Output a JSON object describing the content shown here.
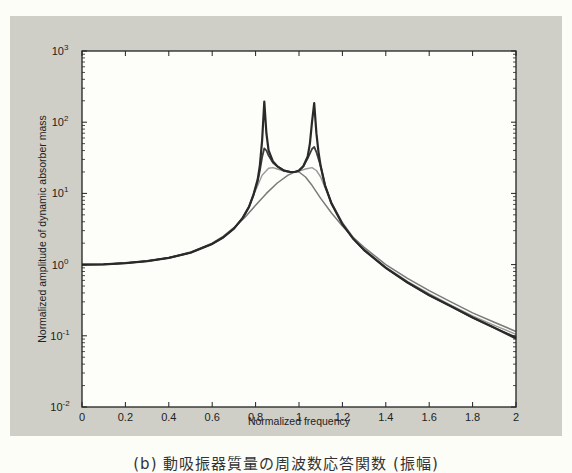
{
  "chart_data": {
    "type": "line",
    "title": "",
    "xlabel": "Normalized frequency",
    "ylabel": "Normalized amplitude of dynamic absorber mass",
    "xlim": [
      0,
      2
    ],
    "ylim": [
      0.01,
      1000
    ],
    "yscale": "log",
    "grid": false,
    "legend": null,
    "x_ticks": [
      "0",
      "0.2",
      "0.4",
      "0.6",
      "0.8",
      "1",
      "1.2",
      "1.4",
      "1.6",
      "1.8",
      "2"
    ],
    "y_ticks": [
      {
        "base": "10",
        "exp": "3",
        "value": 1000
      },
      {
        "base": "10",
        "exp": "2",
        "value": 100
      },
      {
        "base": "10",
        "exp": "1",
        "value": 10
      },
      {
        "base": "10",
        "exp": "0",
        "value": 1
      },
      {
        "base": "10",
        "exp": "-1",
        "value": 0.1
      },
      {
        "base": "10",
        "exp": "-2",
        "value": 0.01
      }
    ],
    "series": [
      {
        "name": "low damping",
        "color": "#2a2a2a",
        "width": 2.2,
        "points": [
          [
            0,
            1.0
          ],
          [
            0.1,
            1.01
          ],
          [
            0.2,
            1.05
          ],
          [
            0.3,
            1.12
          ],
          [
            0.4,
            1.24
          ],
          [
            0.5,
            1.47
          ],
          [
            0.6,
            1.95
          ],
          [
            0.65,
            2.4
          ],
          [
            0.7,
            3.2
          ],
          [
            0.74,
            4.5
          ],
          [
            0.77,
            6.5
          ],
          [
            0.79,
            9.5
          ],
          [
            0.81,
            16
          ],
          [
            0.82,
            25
          ],
          [
            0.83,
            55
          ],
          [
            0.84,
            195
          ],
          [
            0.85,
            70
          ],
          [
            0.86,
            40
          ],
          [
            0.88,
            28
          ],
          [
            0.9,
            24
          ],
          [
            0.93,
            21
          ],
          [
            0.96,
            20
          ],
          [
            0.98,
            20
          ],
          [
            1.0,
            21
          ],
          [
            1.02,
            24
          ],
          [
            1.04,
            33
          ],
          [
            1.05,
            50
          ],
          [
            1.06,
            100
          ],
          [
            1.07,
            185
          ],
          [
            1.08,
            70
          ],
          [
            1.09,
            38
          ],
          [
            1.1,
            24
          ],
          [
            1.12,
            13
          ],
          [
            1.15,
            7.2
          ],
          [
            1.2,
            3.7
          ],
          [
            1.25,
            2.3
          ],
          [
            1.3,
            1.6
          ],
          [
            1.4,
            0.9
          ],
          [
            1.5,
            0.56
          ],
          [
            1.6,
            0.37
          ],
          [
            1.7,
            0.26
          ],
          [
            1.8,
            0.18
          ],
          [
            1.9,
            0.13
          ],
          [
            2.0,
            0.092
          ]
        ]
      },
      {
        "name": "medium damping",
        "color": "#3c3c3c",
        "width": 1.8,
        "points": [
          [
            0,
            1.0
          ],
          [
            0.1,
            1.01
          ],
          [
            0.2,
            1.05
          ],
          [
            0.3,
            1.12
          ],
          [
            0.4,
            1.24
          ],
          [
            0.5,
            1.47
          ],
          [
            0.6,
            1.95
          ],
          [
            0.65,
            2.4
          ],
          [
            0.7,
            3.2
          ],
          [
            0.74,
            4.5
          ],
          [
            0.77,
            6.5
          ],
          [
            0.79,
            9.5
          ],
          [
            0.81,
            15
          ],
          [
            0.82,
            21
          ],
          [
            0.83,
            32
          ],
          [
            0.84,
            43
          ],
          [
            0.85,
            40
          ],
          [
            0.86,
            34
          ],
          [
            0.88,
            27
          ],
          [
            0.9,
            24
          ],
          [
            0.93,
            21
          ],
          [
            0.96,
            20
          ],
          [
            0.98,
            20
          ],
          [
            1.0,
            21
          ],
          [
            1.02,
            24
          ],
          [
            1.04,
            31
          ],
          [
            1.06,
            42
          ],
          [
            1.07,
            45
          ],
          [
            1.08,
            38
          ],
          [
            1.1,
            24
          ],
          [
            1.12,
            13
          ],
          [
            1.15,
            7.2
          ],
          [
            1.2,
            3.7
          ],
          [
            1.25,
            2.3
          ],
          [
            1.3,
            1.6
          ],
          [
            1.4,
            0.9
          ],
          [
            1.5,
            0.56
          ],
          [
            1.6,
            0.37
          ],
          [
            1.7,
            0.26
          ],
          [
            1.8,
            0.18
          ],
          [
            1.9,
            0.13
          ],
          [
            2.0,
            0.095
          ]
        ]
      },
      {
        "name": "high damping",
        "color": "#9a9a9a",
        "width": 1.4,
        "points": [
          [
            0,
            1.0
          ],
          [
            0.1,
            1.01
          ],
          [
            0.2,
            1.05
          ],
          [
            0.3,
            1.12
          ],
          [
            0.4,
            1.24
          ],
          [
            0.5,
            1.47
          ],
          [
            0.6,
            1.95
          ],
          [
            0.65,
            2.4
          ],
          [
            0.7,
            3.2
          ],
          [
            0.74,
            4.6
          ],
          [
            0.77,
            6.7
          ],
          [
            0.8,
            11
          ],
          [
            0.83,
            18
          ],
          [
            0.86,
            22.5
          ],
          [
            0.88,
            23
          ],
          [
            0.9,
            22
          ],
          [
            0.93,
            20.5
          ],
          [
            0.96,
            20
          ],
          [
            0.98,
            20
          ],
          [
            1.0,
            20.5
          ],
          [
            1.03,
            22
          ],
          [
            1.06,
            23
          ],
          [
            1.08,
            21
          ],
          [
            1.1,
            17
          ],
          [
            1.12,
            12
          ],
          [
            1.15,
            7.5
          ],
          [
            1.2,
            3.9
          ],
          [
            1.25,
            2.4
          ],
          [
            1.3,
            1.65
          ],
          [
            1.4,
            0.92
          ],
          [
            1.5,
            0.58
          ],
          [
            1.6,
            0.39
          ],
          [
            1.7,
            0.27
          ],
          [
            1.8,
            0.19
          ],
          [
            1.9,
            0.14
          ],
          [
            2.0,
            0.105
          ]
        ]
      },
      {
        "name": "very high damping",
        "color": "#7a7a7a",
        "width": 1.5,
        "points": [
          [
            0,
            1.0
          ],
          [
            0.1,
            1.01
          ],
          [
            0.2,
            1.05
          ],
          [
            0.3,
            1.12
          ],
          [
            0.4,
            1.25
          ],
          [
            0.5,
            1.5
          ],
          [
            0.6,
            2.0
          ],
          [
            0.65,
            2.5
          ],
          [
            0.7,
            3.3
          ],
          [
            0.75,
            4.6
          ],
          [
            0.8,
            6.8
          ],
          [
            0.85,
            10
          ],
          [
            0.9,
            14
          ],
          [
            0.95,
            18
          ],
          [
            0.98,
            20
          ],
          [
            1.0,
            20
          ],
          [
            1.03,
            17
          ],
          [
            1.06,
            13
          ],
          [
            1.1,
            8.5
          ],
          [
            1.15,
            5.3
          ],
          [
            1.2,
            3.5
          ],
          [
            1.25,
            2.4
          ],
          [
            1.3,
            1.75
          ],
          [
            1.4,
            1.0
          ],
          [
            1.5,
            0.64
          ],
          [
            1.6,
            0.43
          ],
          [
            1.7,
            0.3
          ],
          [
            1.8,
            0.21
          ],
          [
            1.9,
            0.155
          ],
          [
            2.0,
            0.115
          ]
        ]
      }
    ]
  },
  "caption": "(b) 動吸振器質量の周波数応答関数 (振幅)"
}
